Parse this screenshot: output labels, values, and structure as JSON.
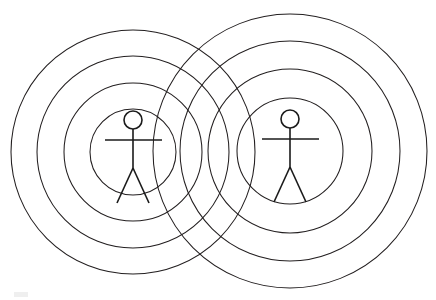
{
  "diagram": {
    "title": "Two stick figures each surrounded by four concentric circles",
    "background_color": "#ffffff",
    "stroke_color": "#231f20",
    "figure_stroke_color": "#1a1a1a",
    "canvas": {
      "width": 436,
      "height": 300
    },
    "groups": [
      {
        "id": "left-group",
        "label": "Left person with concentric rings",
        "center": {
          "x": 133,
          "y": 152
        },
        "rings": [
          {
            "index": 1,
            "name": "inner-ring",
            "radius": 43
          },
          {
            "index": 2,
            "name": "second-ring",
            "radius": 69
          },
          {
            "index": 3,
            "name": "third-ring",
            "radius": 96
          },
          {
            "index": 4,
            "name": "outer-ring",
            "radius": 122
          }
        ],
        "figure": {
          "label": "left-stick-figure",
          "head": {
            "cx": 133,
            "cy": 120,
            "r": 9
          },
          "spine": {
            "x1": 133,
            "y1": 129,
            "x2": 133,
            "y2": 168
          },
          "arms": {
            "x1": 105,
            "y1": 140,
            "x2": 162,
            "y2": 140
          },
          "left_leg": {
            "x1": 133,
            "y1": 168,
            "x2": 117,
            "y2": 203
          },
          "right_leg": {
            "x1": 133,
            "y1": 168,
            "x2": 149,
            "y2": 203
          }
        }
      },
      {
        "id": "right-group",
        "label": "Right person with concentric rings",
        "center": {
          "x": 290,
          "y": 151
        },
        "rings": [
          {
            "index": 1,
            "name": "inner-ring",
            "radius": 53
          },
          {
            "index": 2,
            "name": "second-ring",
            "radius": 82
          },
          {
            "index": 3,
            "name": "third-ring",
            "radius": 110
          },
          {
            "index": 4,
            "name": "outer-ring",
            "radius": 137
          }
        ],
        "figure": {
          "label": "right-stick-figure",
          "head": {
            "cx": 290,
            "cy": 119,
            "r": 9
          },
          "spine": {
            "x1": 290,
            "y1": 128,
            "x2": 290,
            "y2": 167
          },
          "arms": {
            "x1": 262,
            "y1": 139,
            "x2": 319,
            "y2": 139
          },
          "left_leg": {
            "x1": 290,
            "y1": 167,
            "x2": 274,
            "y2": 202
          },
          "right_leg": {
            "x1": 290,
            "y1": 167,
            "x2": 306,
            "y2": 202
          }
        }
      }
    ],
    "artifacts": [
      {
        "name": "scan-smudge",
        "x": 14,
        "y": 292,
        "width": 14,
        "height": 5
      }
    ]
  }
}
